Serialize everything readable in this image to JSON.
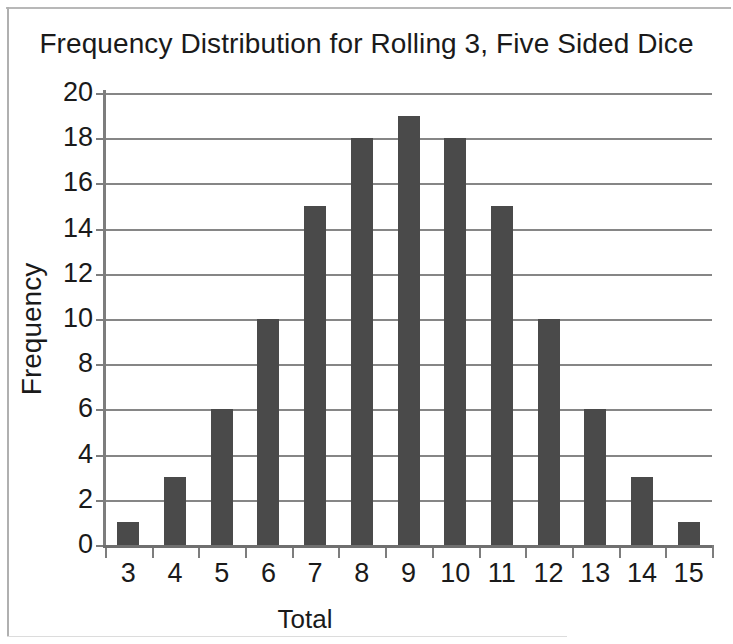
{
  "chart_data": {
    "type": "bar",
    "title": "Frequency Distribution for Rolling 3, Five Sided Dice",
    "xlabel": "Total",
    "ylabel": "Frequency",
    "categories": [
      "3",
      "4",
      "5",
      "6",
      "7",
      "8",
      "9",
      "10",
      "11",
      "12",
      "13",
      "14",
      "15"
    ],
    "values": [
      1,
      3,
      6,
      10,
      15,
      18,
      19,
      18,
      15,
      10,
      6,
      3,
      1
    ],
    "ylim": [
      0,
      20
    ],
    "ytick_step": 2,
    "yticks": [
      "20",
      "18",
      "16",
      "14",
      "12",
      "10",
      "8",
      "6",
      "4",
      "2",
      "0"
    ],
    "ytick_values": [
      20,
      18,
      16,
      14,
      12,
      10,
      8,
      6,
      4,
      2,
      0
    ],
    "grid": "horizontal",
    "legend": "none",
    "series": [
      {
        "name": "Frequency",
        "values": [
          1,
          3,
          6,
          10,
          15,
          18,
          19,
          18,
          15,
          10,
          6,
          3,
          1
        ]
      }
    ],
    "bar_color": "#4a4a4a",
    "gridline_color": "#868686",
    "axis_color": "#7d7d7d",
    "text_color": "#1a1a1a",
    "background_color": "#ffffff"
  }
}
